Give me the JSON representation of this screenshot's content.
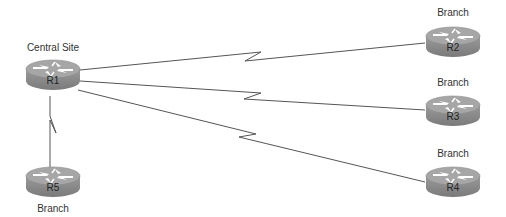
{
  "diagram": {
    "type": "hub-and-spoke WAN topology",
    "colors": {
      "router_body": "#8c8c8c",
      "router_top": "#a3a3a3",
      "router_dark": "#6e6e6e",
      "link": "#555555",
      "arrow": "#ffffff"
    },
    "nodes": [
      {
        "id": "R1",
        "label": "R1",
        "caption": "Central Site",
        "cx": 53,
        "cy": 73
      },
      {
        "id": "R2",
        "label": "R2",
        "caption": "Branch",
        "cx": 453,
        "cy": 40
      },
      {
        "id": "R3",
        "label": "R3",
        "caption": "Branch",
        "cx": 453,
        "cy": 109
      },
      {
        "id": "R4",
        "label": "R4",
        "caption": "Branch",
        "cx": 453,
        "cy": 180
      },
      {
        "id": "R5",
        "label": "R5",
        "caption": "Branch",
        "cx": 53,
        "cy": 180
      }
    ],
    "links": [
      {
        "from": "R1",
        "to": "R2",
        "style": "serial"
      },
      {
        "from": "R1",
        "to": "R3",
        "style": "serial"
      },
      {
        "from": "R1",
        "to": "R4",
        "style": "serial"
      },
      {
        "from": "R1",
        "to": "R5",
        "style": "serial"
      }
    ]
  }
}
